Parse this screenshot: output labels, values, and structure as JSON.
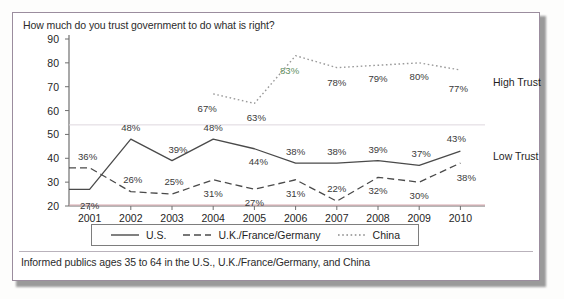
{
  "card": {
    "title": "How much do you trust government to do what is right?",
    "footnote": "Informed publics ages 35 to 64 in the U.S., U.K./France/Germany, and China"
  },
  "annotations": {
    "high_trust": "High Trust",
    "low_trust": "Low Trust"
  },
  "legend": {
    "items": [
      {
        "label": "U.S.",
        "style": "solid",
        "color": "#4a4a4a"
      },
      {
        "label": "U.K./France/Germany",
        "style": "dashed",
        "color": "#4a4a4a"
      },
      {
        "label": "China",
        "style": "dotted",
        "color": "#8a8a8a"
      }
    ]
  },
  "chart_data": {
    "type": "line",
    "title": "How much do you trust government to do what is right?",
    "xlabel": "",
    "ylabel": "",
    "ylim": [
      20,
      90
    ],
    "yticks": [
      20,
      30,
      40,
      50,
      60,
      70,
      80,
      90
    ],
    "grid": false,
    "legend_position": "bottom",
    "categories": [
      "2001",
      "2002",
      "2003",
      "2004",
      "2005",
      "2006",
      "2007",
      "2008",
      "2009",
      "2010"
    ],
    "series": [
      {
        "name": "U.S.",
        "style": "solid",
        "values": [
          27,
          48,
          39,
          48,
          44,
          38,
          38,
          39,
          37,
          43
        ],
        "labels": [
          "27%",
          "48%",
          "39%",
          "48%",
          "44%",
          "38%",
          "38%",
          "39%",
          "37%",
          "43%"
        ]
      },
      {
        "name": "U.K./France/Germany",
        "style": "dashed",
        "values": [
          36,
          26,
          25,
          31,
          27,
          31,
          22,
          32,
          30,
          38
        ],
        "labels": [
          "36%",
          "26%",
          "25%",
          "31%",
          "27%",
          "31%",
          "22%",
          "32%",
          "30%",
          "38%"
        ]
      },
      {
        "name": "China",
        "style": "dotted",
        "values": [
          null,
          null,
          null,
          67,
          63,
          83,
          78,
          79,
          80,
          77
        ],
        "labels": [
          null,
          null,
          null,
          "67%",
          "63%",
          "83%",
          "78%",
          "79%",
          "80%",
          "77%"
        ]
      }
    ],
    "annotations": [
      {
        "text": "High Trust",
        "value": 72
      },
      {
        "text": "Low Trust",
        "value": 41
      }
    ]
  }
}
